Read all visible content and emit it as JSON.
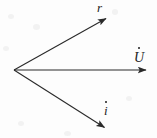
{
  "figure": {
    "background_color": "#fdfdfd",
    "stroke_color": "#2a2a2a",
    "origin": {
      "x": 14,
      "y": 70
    },
    "vectors": [
      {
        "id": "r-dot",
        "label": "r",
        "accent": "dot",
        "label_text": "ṙ",
        "from": {
          "x": 14,
          "y": 70
        },
        "to": {
          "x": 108,
          "y": 17
        },
        "label_position": {
          "x": 97,
          "y": 1
        }
      },
      {
        "id": "u-dot",
        "label": "U",
        "accent": "dot",
        "label_text": "U̇",
        "from": {
          "x": 14,
          "y": 70
        },
        "to": {
          "x": 148,
          "y": 70
        },
        "label_position": {
          "x": 134,
          "y": 51
        }
      },
      {
        "id": "i-dot",
        "label": "i",
        "accent": "dot",
        "label_text": "i̇",
        "from": {
          "x": 14,
          "y": 70
        },
        "to": {
          "x": 106,
          "y": 129
        },
        "label_position": {
          "x": 104,
          "y": 104
        }
      }
    ]
  }
}
